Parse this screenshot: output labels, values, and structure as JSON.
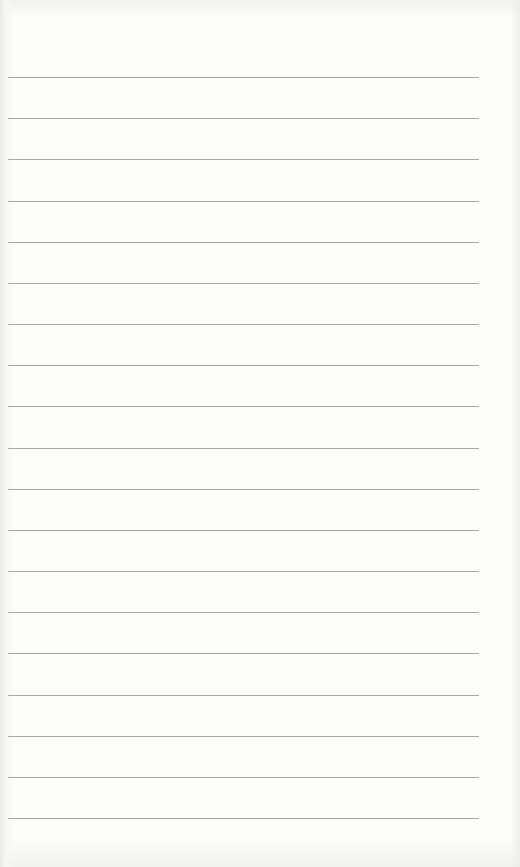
{
  "document": {
    "type": "ruled-paper",
    "background_color": "#fdfdfc",
    "rule_color": "#9a9a98",
    "rules": {
      "count": 19,
      "first_y": 77,
      "spacing": 41.17,
      "left_x": 8,
      "right_x": 479
    },
    "text": []
  }
}
